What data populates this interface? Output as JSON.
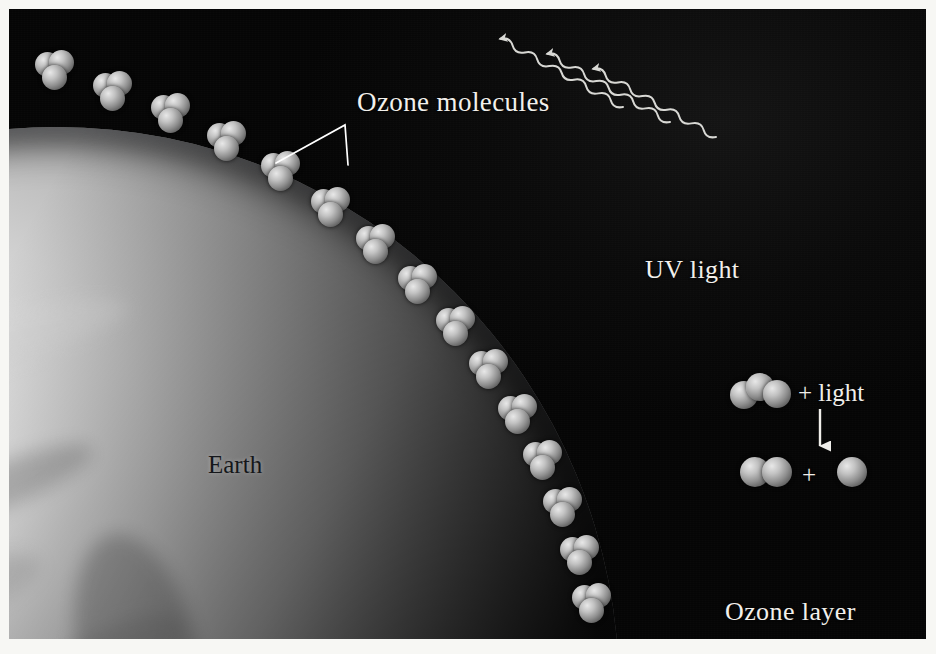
{
  "figure": {
    "title_labels": {
      "ozone_molecules": "Ozone molecules",
      "uv_light": "UV light",
      "earth": "Earth",
      "ozone_layer": "Ozone layer"
    },
    "reaction": {
      "plus_light": "+ light",
      "plus": "+",
      "reactant_atoms": 3,
      "product_a_atoms": 2,
      "product_b_atoms": 1,
      "arrow": "down-arrow"
    },
    "uv_rays": 3,
    "ozone_molecule_count": 19,
    "colors": {
      "background": "#070707",
      "label_text": "#f2f0ec",
      "earth_label_text": "#15171a",
      "molecule_light": "#e8e8e8",
      "molecule_dark": "#3a3a3a",
      "ray_stroke": "#d8d8d4",
      "leader_line": "#ffffff"
    }
  }
}
